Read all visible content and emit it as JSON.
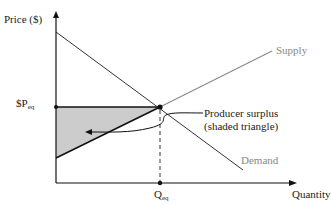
{
  "diagram": {
    "type": "supply-demand",
    "y_axis_label": "Price ($)",
    "x_axis_label": "Quantity",
    "price_label_prefix": "$P",
    "price_label_sub": "eq",
    "quantity_label_prefix": "Q",
    "quantity_label_sub": "eq",
    "supply_label": "Supply",
    "demand_label": "Demand",
    "annotation_line1": "Producer surplus",
    "annotation_line2": "(shaded triangle)",
    "colors": {
      "axis": "#111111",
      "demand_line": "#333333",
      "supply_line": "#777777",
      "shade": "#cccccc",
      "curve_label": "#888888"
    }
  }
}
